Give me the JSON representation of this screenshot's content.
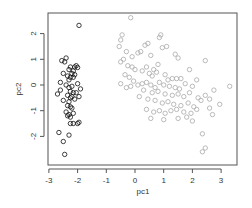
{
  "chart_data": {
    "type": "scatter",
    "title": "",
    "xlabel": "pc1",
    "ylabel": "pc2",
    "xlim": [
      -3.05,
      3.55
    ],
    "ylim": [
      -2.85,
      2.8
    ],
    "x_ticks": [
      -3,
      -2,
      -1,
      0,
      1,
      2,
      3
    ],
    "y_ticks": [
      -2,
      -1,
      0,
      1,
      2
    ],
    "grid": false,
    "legend": null,
    "series": [
      {
        "name": "group1",
        "color": "#111111",
        "marker": "open-circle",
        "points": [
          [
            -1.95,
            2.32
          ],
          [
            -2.4,
            1.05
          ],
          [
            -2.55,
            0.95
          ],
          [
            -2.45,
            0.9
          ],
          [
            -2.25,
            0.7
          ],
          [
            -2.1,
            0.7
          ],
          [
            -2.05,
            0.75
          ],
          [
            -2.0,
            0.68
          ],
          [
            -2.3,
            0.6
          ],
          [
            -2.15,
            0.55
          ],
          [
            -2.5,
            0.45
          ],
          [
            -2.2,
            0.45
          ],
          [
            -2.1,
            0.4
          ],
          [
            -2.35,
            0.35
          ],
          [
            -2.25,
            0.3
          ],
          [
            -2.15,
            0.3
          ],
          [
            -2.3,
            0.2
          ],
          [
            -2.6,
            0.1
          ],
          [
            -2.0,
            0.05
          ],
          [
            -2.4,
            0.0
          ],
          [
            -2.2,
            -0.05
          ],
          [
            -2.3,
            -0.1
          ],
          [
            -1.9,
            -0.15
          ],
          [
            -2.6,
            -0.2
          ],
          [
            -2.25,
            -0.25
          ],
          [
            -2.15,
            -0.3
          ],
          [
            -2.05,
            -0.3
          ],
          [
            -2.7,
            -0.35
          ],
          [
            -2.35,
            -0.4
          ],
          [
            -2.2,
            -0.45
          ],
          [
            -1.95,
            -0.45
          ],
          [
            -2.25,
            -0.5
          ],
          [
            -2.1,
            -0.55
          ],
          [
            -2.5,
            -0.6
          ],
          [
            -2.3,
            -0.65
          ],
          [
            -2.35,
            -0.8
          ],
          [
            -2.25,
            -0.85
          ],
          [
            -2.2,
            -0.9
          ],
          [
            -2.4,
            -1.05
          ],
          [
            -2.3,
            -1.15
          ],
          [
            -2.35,
            -1.2
          ],
          [
            -2.15,
            -1.1
          ],
          [
            -2.25,
            -1.25
          ],
          [
            -2.0,
            -1.5
          ],
          [
            -2.15,
            -1.5
          ],
          [
            -2.25,
            -1.5
          ],
          [
            -1.95,
            -1.45
          ],
          [
            -2.65,
            -1.85
          ],
          [
            -2.3,
            -1.95
          ],
          [
            -2.5,
            -2.2
          ],
          [
            -2.45,
            -2.7
          ]
        ]
      },
      {
        "name": "group2",
        "color": "#aaaaaa",
        "marker": "open-circle",
        "points": [
          [
            -0.15,
            2.62
          ],
          [
            -0.45,
            1.95
          ],
          [
            -0.5,
            1.75
          ],
          [
            -0.55,
            1.5
          ],
          [
            0.35,
            1.55
          ],
          [
            0.45,
            1.62
          ],
          [
            0.85,
            1.85
          ],
          [
            0.9,
            1.95
          ],
          [
            0.95,
            1.45
          ],
          [
            1.1,
            1.5
          ],
          [
            -0.3,
            1.3
          ],
          [
            -0.1,
            1.1
          ],
          [
            0.1,
            1.25
          ],
          [
            0.2,
            1.3
          ],
          [
            0.55,
            1.15
          ],
          [
            1.4,
            1.2
          ],
          [
            1.5,
            1.05
          ],
          [
            -0.4,
            1.0
          ],
          [
            -0.5,
            0.9
          ],
          [
            -0.25,
            0.75
          ],
          [
            -0.1,
            0.7
          ],
          [
            0.0,
            0.6
          ],
          [
            0.25,
            0.55
          ],
          [
            0.4,
            0.7
          ],
          [
            0.5,
            0.45
          ],
          [
            0.65,
            0.6
          ],
          [
            0.75,
            0.5
          ],
          [
            0.6,
            0.35
          ],
          [
            0.8,
            0.8
          ],
          [
            1.05,
            0.4
          ],
          [
            1.15,
            0.2
          ],
          [
            1.3,
            0.25
          ],
          [
            1.45,
            0.25
          ],
          [
            1.6,
            0.25
          ],
          [
            1.9,
            0.6
          ],
          [
            2.45,
            0.95
          ],
          [
            -0.35,
            0.4
          ],
          [
            -0.2,
            0.3
          ],
          [
            -0.05,
            0.15
          ],
          [
            0.1,
            0.0
          ],
          [
            0.25,
            0.05
          ],
          [
            0.4,
            0.1
          ],
          [
            0.55,
            0.0
          ],
          [
            0.7,
            -0.1
          ],
          [
            0.85,
            0.1
          ],
          [
            1.0,
            0.0
          ],
          [
            1.2,
            -0.05
          ],
          [
            1.4,
            -0.1
          ],
          [
            1.55,
            -0.15
          ],
          [
            1.75,
            0.05
          ],
          [
            2.0,
            -0.05
          ],
          [
            2.15,
            0.2
          ],
          [
            -0.5,
            0.05
          ],
          [
            -0.3,
            -0.1
          ],
          [
            -0.15,
            -0.05
          ],
          [
            0.3,
            -0.2
          ],
          [
            0.6,
            -0.3
          ],
          [
            0.8,
            -0.25
          ],
          [
            1.05,
            -0.35
          ],
          [
            1.3,
            -0.4
          ],
          [
            1.5,
            -0.35
          ],
          [
            1.7,
            -0.45
          ],
          [
            1.9,
            -0.3
          ],
          [
            2.2,
            -0.5
          ],
          [
            2.45,
            -0.4
          ],
          [
            2.75,
            -0.2
          ],
          [
            3.3,
            -0.05
          ],
          [
            0.15,
            -0.45
          ],
          [
            0.45,
            -0.55
          ],
          [
            0.7,
            -0.6
          ],
          [
            0.95,
            -0.7
          ],
          [
            1.15,
            -0.65
          ],
          [
            1.35,
            -0.75
          ],
          [
            1.6,
            -0.8
          ],
          [
            1.85,
            -0.7
          ],
          [
            2.05,
            -0.85
          ],
          [
            2.3,
            -0.6
          ],
          [
            2.6,
            -0.55
          ],
          [
            2.95,
            -0.75
          ],
          [
            0.4,
            -0.95
          ],
          [
            0.65,
            -1.05
          ],
          [
            0.85,
            -1.0
          ],
          [
            1.05,
            -1.1
          ],
          [
            1.25,
            -1.0
          ],
          [
            1.45,
            -0.95
          ],
          [
            1.7,
            -1.05
          ],
          [
            1.95,
            -1.1
          ],
          [
            2.15,
            -0.95
          ],
          [
            0.55,
            -1.3
          ],
          [
            1.0,
            -1.35
          ],
          [
            1.5,
            -1.3
          ],
          [
            1.8,
            -1.25
          ],
          [
            2.0,
            -1.4
          ],
          [
            2.6,
            -0.9
          ],
          [
            2.7,
            -1.15
          ],
          [
            2.35,
            -1.9
          ],
          [
            2.45,
            -2.45
          ],
          [
            2.35,
            -2.6
          ]
        ]
      }
    ]
  }
}
